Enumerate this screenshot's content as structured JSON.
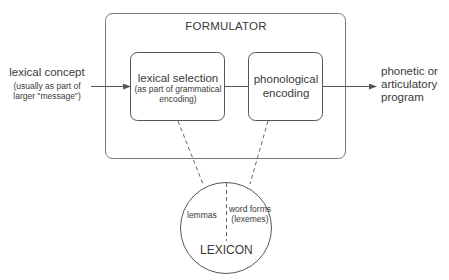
{
  "formulator": {
    "title": "FORMULATOR",
    "lexical_selection": {
      "title": "lexical selection",
      "subtitle_line1": "(as part of grammatical",
      "subtitle_line2": "encoding)"
    },
    "phonological_encoding": {
      "line1": "phonological",
      "line2": "encoding"
    }
  },
  "input": {
    "title": "lexical concept",
    "subtitle_line1": "(usually as part of",
    "subtitle_line2": "larger \"message\")"
  },
  "output": {
    "line1": "phonetic or",
    "line2": "articulatory",
    "line3": "program"
  },
  "lexicon": {
    "title": "LEXICON",
    "left_label": "lemmas",
    "right_label_line1": "word forms",
    "right_label_line2": "(lexemes)"
  },
  "colors": {
    "stroke": "#6b6b6b",
    "text": "#3a3a3a",
    "background": "#ffffff"
  }
}
